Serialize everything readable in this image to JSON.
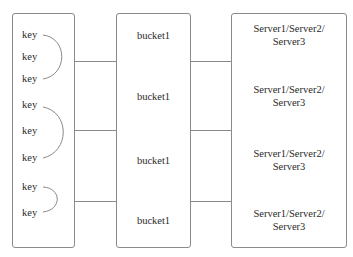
{
  "diagram": {
    "keys_column": {
      "groups": [
        {
          "keys": [
            "key",
            "key",
            "key"
          ]
        },
        {
          "keys": [
            "key",
            "key",
            "key"
          ]
        },
        {
          "keys": [
            "key",
            "key"
          ]
        }
      ]
    },
    "buckets_column": {
      "buckets": [
        {
          "label": "bucket1"
        },
        {
          "label": "bucket1"
        },
        {
          "label": "bucket1"
        },
        {
          "label": "bucket1"
        }
      ]
    },
    "servers_column": {
      "entries": [
        {
          "line1": "Server1/Server2/",
          "line2": "Server3"
        },
        {
          "line1": "Server1/Server2/",
          "line2": "Server3"
        },
        {
          "line1": "Server1/Server2/",
          "line2": "Server3"
        },
        {
          "line1": "Server1/Server2/",
          "line2": "Server3"
        }
      ]
    },
    "colors": {
      "border": "#8a8a8a",
      "text": "#2a2a2a",
      "background": "#ffffff"
    }
  }
}
